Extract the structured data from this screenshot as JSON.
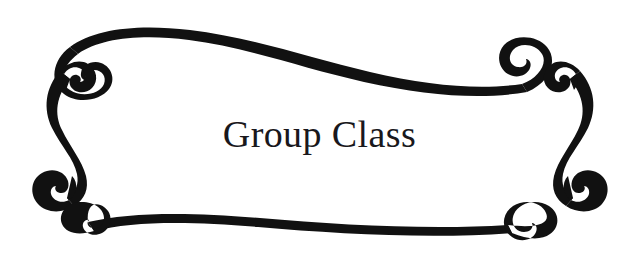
{
  "canvas": {
    "width": 640,
    "height": 262,
    "background_color": "#ffffff"
  },
  "title": {
    "text": "Group Class",
    "color": "#19181c",
    "font_style": "serif",
    "font_size_px": 38,
    "align": "center"
  },
  "ornament": {
    "name": "calligraphic-scroll-frame",
    "color": "#111111",
    "description": "Decorative double-scroll cartouche border with spiral terminals at four corners",
    "parts": [
      "top-sweep",
      "bottom-sweep",
      "left-s-scroll",
      "right-s-scroll",
      "top-left-spiral",
      "top-right-spiral",
      "bottom-left-spiral",
      "bottom-right-spiral"
    ]
  }
}
